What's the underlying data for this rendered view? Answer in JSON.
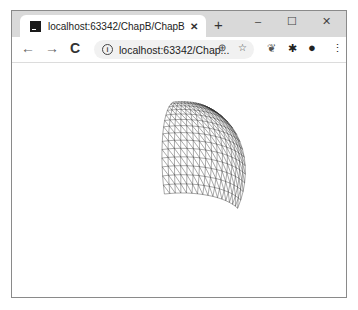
{
  "browser": {
    "tab": {
      "title": "localhost:63342/ChapB/ChapB",
      "favicon": "intellij-icon",
      "close_glyph": "✕"
    },
    "new_tab_glyph": "+",
    "window_controls": {
      "minimize": "–",
      "maximize": "☐",
      "close": "✕"
    },
    "nav": {
      "back": "←",
      "forward": "→",
      "reload": "C"
    },
    "omnibox": {
      "info_glyph": "i",
      "url": "localhost:63342/Chap...",
      "zoom_glyph": "⊕",
      "bookmark_glyph": "☆"
    },
    "toolbar_icons": {
      "extension_bird": "❦",
      "extensions_puzzle": "✱",
      "profile": "●",
      "menu": "⋮"
    }
  },
  "canvas": {
    "description": "Three.js wireframe curved surface (sphere segment) rendered in black on white",
    "mesh_color": "#333333",
    "background": "#ffffff"
  }
}
